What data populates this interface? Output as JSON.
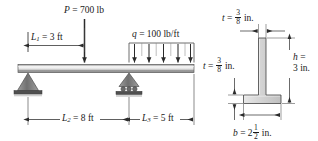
{
  "figure": {
    "type": "beam-loading-and-cross-section-diagram",
    "beam": {
      "point_load": {
        "symbol": "P",
        "equals": " = 700 lb",
        "value": 700,
        "unit": "lb",
        "full_label": "P = 700 lb"
      },
      "distributed_load": {
        "symbol": "q",
        "equals": " = 100 lb/ft",
        "value": 100,
        "unit": "lb/ft",
        "full_label": "q = 100 lb/ft",
        "arrow_count": 5
      },
      "dimensions": [
        {
          "symbol": "L",
          "subscript": "1",
          "equals": " = 3 ft",
          "value": 3,
          "unit": "ft",
          "full_label": "L1 = 3 ft",
          "description": "distance from left pin support to point load"
        },
        {
          "symbol": "L",
          "subscript": "2",
          "equals": " = 8 ft",
          "value": 8,
          "unit": "ft",
          "full_label": "L2 = 8 ft",
          "description": "span between pin support and roller support"
        },
        {
          "symbol": "L",
          "subscript": "3",
          "equals": " = 5 ft",
          "value": 5,
          "unit": "ft",
          "full_label": "L3 = 5 ft",
          "description": "overhang length right of roller support"
        }
      ],
      "supports": [
        {
          "name": "pin-support",
          "position": "left"
        },
        {
          "name": "roller-support",
          "position": "middle",
          "roller_count": 3
        }
      ]
    },
    "cross_section": {
      "shape": "T-section",
      "labels": {
        "thickness_top": {
          "symbol": "t",
          "equals": " = ",
          "num": "3",
          "den": "8",
          "unit": " in.",
          "full_label": "t = 3/8 in.",
          "description": "stem thickness"
        },
        "thickness_left": {
          "symbol": "t",
          "equals": " = ",
          "num": "3",
          "den": "8",
          "unit": " in.",
          "full_label": "t = 3/8 in.",
          "description": "flange thickness"
        },
        "height": {
          "symbol": "h",
          "equals": " =",
          "value": "3 in.",
          "full_label": "h = 3 in.",
          "description": "overall section height"
        },
        "width": {
          "symbol": "b",
          "equals": " = 2",
          "num": "1",
          "den": "2",
          "unit": " in.",
          "full_label": "b = 2 1/2 in.",
          "description": "flange width"
        }
      }
    }
  },
  "colors": {
    "line": "#1a1a1a",
    "beam_light": "#f2f2f2",
    "beam_mid": "#a9a9a9",
    "beam_dark": "#6e6e6e",
    "support_fill": "#9a9a9a",
    "support_dark": "#4a4a4a",
    "section_fill": "#d6d6d6",
    "thin": "#555555"
  }
}
